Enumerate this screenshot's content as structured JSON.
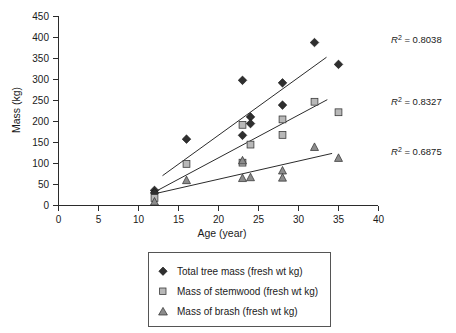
{
  "chart_data": {
    "type": "scatter",
    "title": "",
    "xlabel": "Age (year)",
    "ylabel": "Mass (kg)",
    "xlim": [
      0,
      40
    ],
    "ylim": [
      0,
      450
    ],
    "xticks": [
      0,
      5,
      10,
      15,
      20,
      25,
      30,
      35,
      40
    ],
    "yticks": [
      0,
      50,
      100,
      150,
      200,
      250,
      300,
      350,
      400,
      450
    ],
    "grid": false,
    "legend_position": "below-center",
    "series": [
      {
        "name": "Total tree mass (fresh wt kg)",
        "marker": "diamond",
        "color": "#2f2f2f",
        "points": [
          [
            12,
            36
          ],
          [
            12,
            30
          ],
          [
            16,
            158
          ],
          [
            23,
            298
          ],
          [
            23,
            167
          ],
          [
            24,
            211
          ],
          [
            24,
            195
          ],
          [
            28,
            292
          ],
          [
            28,
            239
          ],
          [
            32,
            388
          ],
          [
            35,
            336
          ]
        ],
        "trendline": {
          "x1": 13.0,
          "y1": 71,
          "x2": 33.5,
          "y2": 353,
          "r2": 0.8038,
          "r2_label": "R² = 0.8038"
        }
      },
      {
        "name": "Mass of stemwood (fresh wt kg)",
        "marker": "square",
        "color": "#b8b8b8",
        "points": [
          [
            12,
            18
          ],
          [
            16,
            99
          ],
          [
            23,
            192
          ],
          [
            23,
            102
          ],
          [
            24,
            145
          ],
          [
            28,
            205
          ],
          [
            28,
            168
          ],
          [
            32,
            247
          ],
          [
            35,
            222
          ]
        ],
        "trendline": {
          "x1": 11.8,
          "y1": 30,
          "x2": 33.6,
          "y2": 252,
          "r2": 0.8327,
          "r2_label": "R² = 0.8327"
        }
      },
      {
        "name": "Mass of brash (fresh wt kg)",
        "marker": "triangle",
        "color": "#8c8c8c",
        "points": [
          [
            12,
            9
          ],
          [
            16,
            60
          ],
          [
            23,
            107
          ],
          [
            23,
            65
          ],
          [
            24,
            67
          ],
          [
            28,
            83
          ],
          [
            28,
            66
          ],
          [
            32,
            139
          ],
          [
            35,
            113
          ]
        ],
        "trendline": {
          "x1": 11.8,
          "y1": 27,
          "x2": 34.2,
          "y2": 124,
          "r2": 0.6875,
          "r2_label": "R² = 0.6875"
        }
      }
    ],
    "annotations": [
      {
        "text": "R² = 0.8038",
        "value": 0.8038,
        "series": "Total tree mass (fresh wt kg)"
      },
      {
        "text": "R² = 0.8327",
        "value": 0.8327,
        "series": "Mass of stemwood (fresh wt kg)"
      },
      {
        "text": "R² = 0.6875",
        "value": 0.6875,
        "series": "Mass of brash (fresh wt kg)"
      }
    ]
  },
  "axes": {
    "y_title": "Mass (kg)",
    "x_title": "Age (year)",
    "y_tick_labels": [
      "450",
      "400",
      "350",
      "300",
      "250",
      "200",
      "150",
      "100",
      "50",
      "0"
    ],
    "x_tick_labels": [
      "0",
      "5",
      "10",
      "15",
      "20",
      "25",
      "30",
      "35",
      "40"
    ]
  },
  "legend": {
    "items": [
      {
        "label": "Total tree mass (fresh wt kg)",
        "marker": "diamond"
      },
      {
        "label": "Mass of stemwood (fresh wt kg)",
        "marker": "square"
      },
      {
        "label": "Mass of brash (fresh wt kg)",
        "marker": "triangle"
      }
    ]
  },
  "r2": {
    "total_tree_mass": "R² = 0.8038",
    "stemwood": "R² = 0.8327",
    "brash": "R² = 0.6875",
    "total_tree_mass_prefix": "R",
    "total_tree_mass_rest": " = 0.8038",
    "stemwood_rest": " = 0.8327",
    "brash_rest": " = 0.6875",
    "superscript": "2"
  }
}
